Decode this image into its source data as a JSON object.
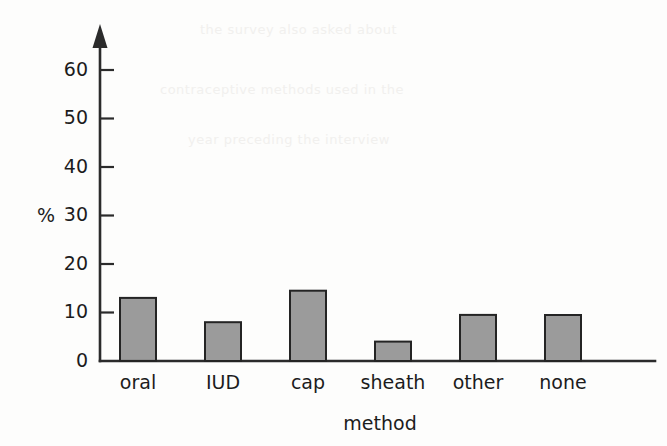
{
  "chart_data": {
    "type": "bar",
    "title": "",
    "subtitle": "",
    "categories": [
      "oral",
      "IUD",
      "cap",
      "sheath",
      "other",
      "none"
    ],
    "values": [
      51,
      13,
      8,
      14.5,
      4,
      9.5
    ],
    "series": [
      {
        "name": "percentage of women",
        "values": [
          51,
          13,
          8,
          14.5,
          4,
          9.5
        ]
      }
    ],
    "xlabel": "method",
    "ylabel": "%",
    "ylim": [
      0,
      65
    ],
    "yticks": [
      0,
      10,
      20,
      30,
      40,
      50,
      60
    ],
    "ytick_labels": [
      "0",
      "10",
      "20",
      "30",
      "40",
      "50",
      "60"
    ],
    "xtick_labels": [
      "oral",
      "IUD",
      "cap",
      "sheath",
      "other",
      "none"
    ],
    "grid": false,
    "legend": false,
    "legend_position": "none",
    "bar_color": "#9b9b9b",
    "bar_edge_color": "#242424",
    "axis_color": "#2b2b2b",
    "background_color": "#fdfdfc",
    "y_axis_arrow": true
  },
  "background_text": {
    "lines": [
      "the survey also asked about",
      "contraceptive methods used in the",
      "year preceding the interview"
    ]
  }
}
